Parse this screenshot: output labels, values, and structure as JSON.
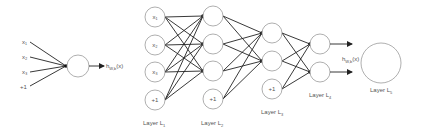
{
  "colors": {
    "background": "#ffffff",
    "node_stroke": "#9a9a9a",
    "edge": "#222222",
    "text": "#555555"
  },
  "single_neuron": {
    "inputs": [
      "x₁",
      "x₂",
      "x₃",
      "+1"
    ],
    "output_label": "h",
    "output_subscript": "W,b",
    "output_arg": "(x)"
  },
  "network": {
    "layers": [
      {
        "label": "Layer L",
        "subscript": "1",
        "nodes": [
          "x₁",
          "x₂",
          "x₃",
          "+1"
        ]
      },
      {
        "label": "Layer L",
        "subscript": "2",
        "nodes": [
          "",
          "",
          "",
          "+1"
        ]
      },
      {
        "label": "Layer L",
        "subscript": "3",
        "nodes": [
          "",
          "",
          "+1"
        ]
      },
      {
        "label": "Layer L",
        "subscript": "4",
        "nodes": [
          "",
          ""
        ]
      },
      {
        "label": "Layer L",
        "subscript": "5",
        "nodes": [
          ""
        ]
      }
    ],
    "output_label": "h",
    "output_subscript": "W,b",
    "output_arg": "(x)"
  }
}
